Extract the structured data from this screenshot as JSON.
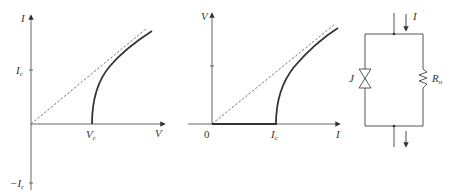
{
  "panels": {
    "iv_voltage_axis": {
      "y_axis_label": "I",
      "x_axis_label": "V",
      "y_tick_pos": "I",
      "y_tick_pos_sub": "c",
      "y_tick_neg": "−I",
      "y_tick_neg_sub": "c",
      "x_tick": "V",
      "x_tick_sub": "c"
    },
    "iv_current_axis": {
      "y_axis_label": "V",
      "x_axis_label": "I",
      "origin_label": "0",
      "x_tick": "I",
      "x_tick_sub": "c"
    },
    "circuit": {
      "current_label": "I",
      "junction_label": "J",
      "resistor_label": "R",
      "resistor_sub": "n"
    }
  },
  "colors": {
    "line": "#333333",
    "axis": "#555555",
    "dashed": "#555555"
  }
}
